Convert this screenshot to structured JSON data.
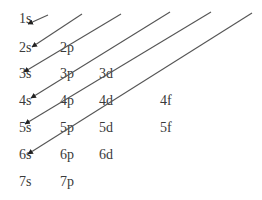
{
  "colors": {
    "text": "#3a3a3a",
    "line": "#555555",
    "background": "#ffffff"
  },
  "rows": [
    {
      "n": 1,
      "orbitals": [
        "1s"
      ]
    },
    {
      "n": 2,
      "orbitals": [
        "2s",
        "2p"
      ]
    },
    {
      "n": 3,
      "orbitals": [
        "3s",
        "3p",
        "3d"
      ]
    },
    {
      "n": 4,
      "orbitals": [
        "4s",
        "4p",
        "4d",
        "4f"
      ]
    },
    {
      "n": 5,
      "orbitals": [
        "5s",
        "5p",
        "5d",
        "5f"
      ]
    },
    {
      "n": 6,
      "orbitals": [
        "6s",
        "6p",
        "6d"
      ]
    },
    {
      "n": 7,
      "orbitals": [
        "7s",
        "7p"
      ]
    }
  ],
  "arrows": [
    {
      "from": [
        48,
        15
      ],
      "to": [
        28,
        24
      ]
    },
    {
      "from": [
        82,
        14
      ],
      "to": [
        32,
        47
      ]
    },
    {
      "from": [
        121,
        14
      ],
      "to": [
        24,
        72
      ]
    },
    {
      "from": [
        170,
        12
      ],
      "to": [
        31,
        98
      ]
    },
    {
      "from": [
        211,
        12
      ],
      "to": [
        25,
        124
      ]
    },
    {
      "from": [
        252,
        13
      ],
      "to": [
        28,
        154
      ]
    }
  ]
}
